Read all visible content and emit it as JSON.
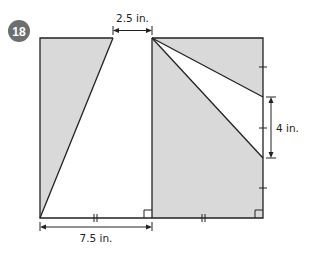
{
  "problem": {
    "number": "18",
    "badge_color": "#6d6e70"
  },
  "figure": {
    "fill_color": "#d9d9d9",
    "stroke_color": "#222222",
    "labels": {
      "top": "2.5 in.",
      "right": "4 in.",
      "bottom": "7.5 in."
    },
    "tick_marks": {
      "bottom_left_segment": "||",
      "bottom_right_segment": "||",
      "right_side": "|"
    }
  }
}
